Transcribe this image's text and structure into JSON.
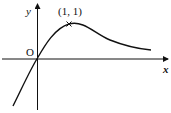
{
  "diagram": {
    "type": "function-graph",
    "axes": {
      "x_label": "x",
      "y_label": "y",
      "origin_label": "O"
    },
    "annotations": [
      {
        "label": "(1, 1)",
        "point": [
          1,
          1
        ],
        "marker": "cross"
      }
    ],
    "curve": {
      "description": "passes through origin, maximum at (1,1), decays toward x-axis as x increases",
      "color": "#111111"
    }
  }
}
